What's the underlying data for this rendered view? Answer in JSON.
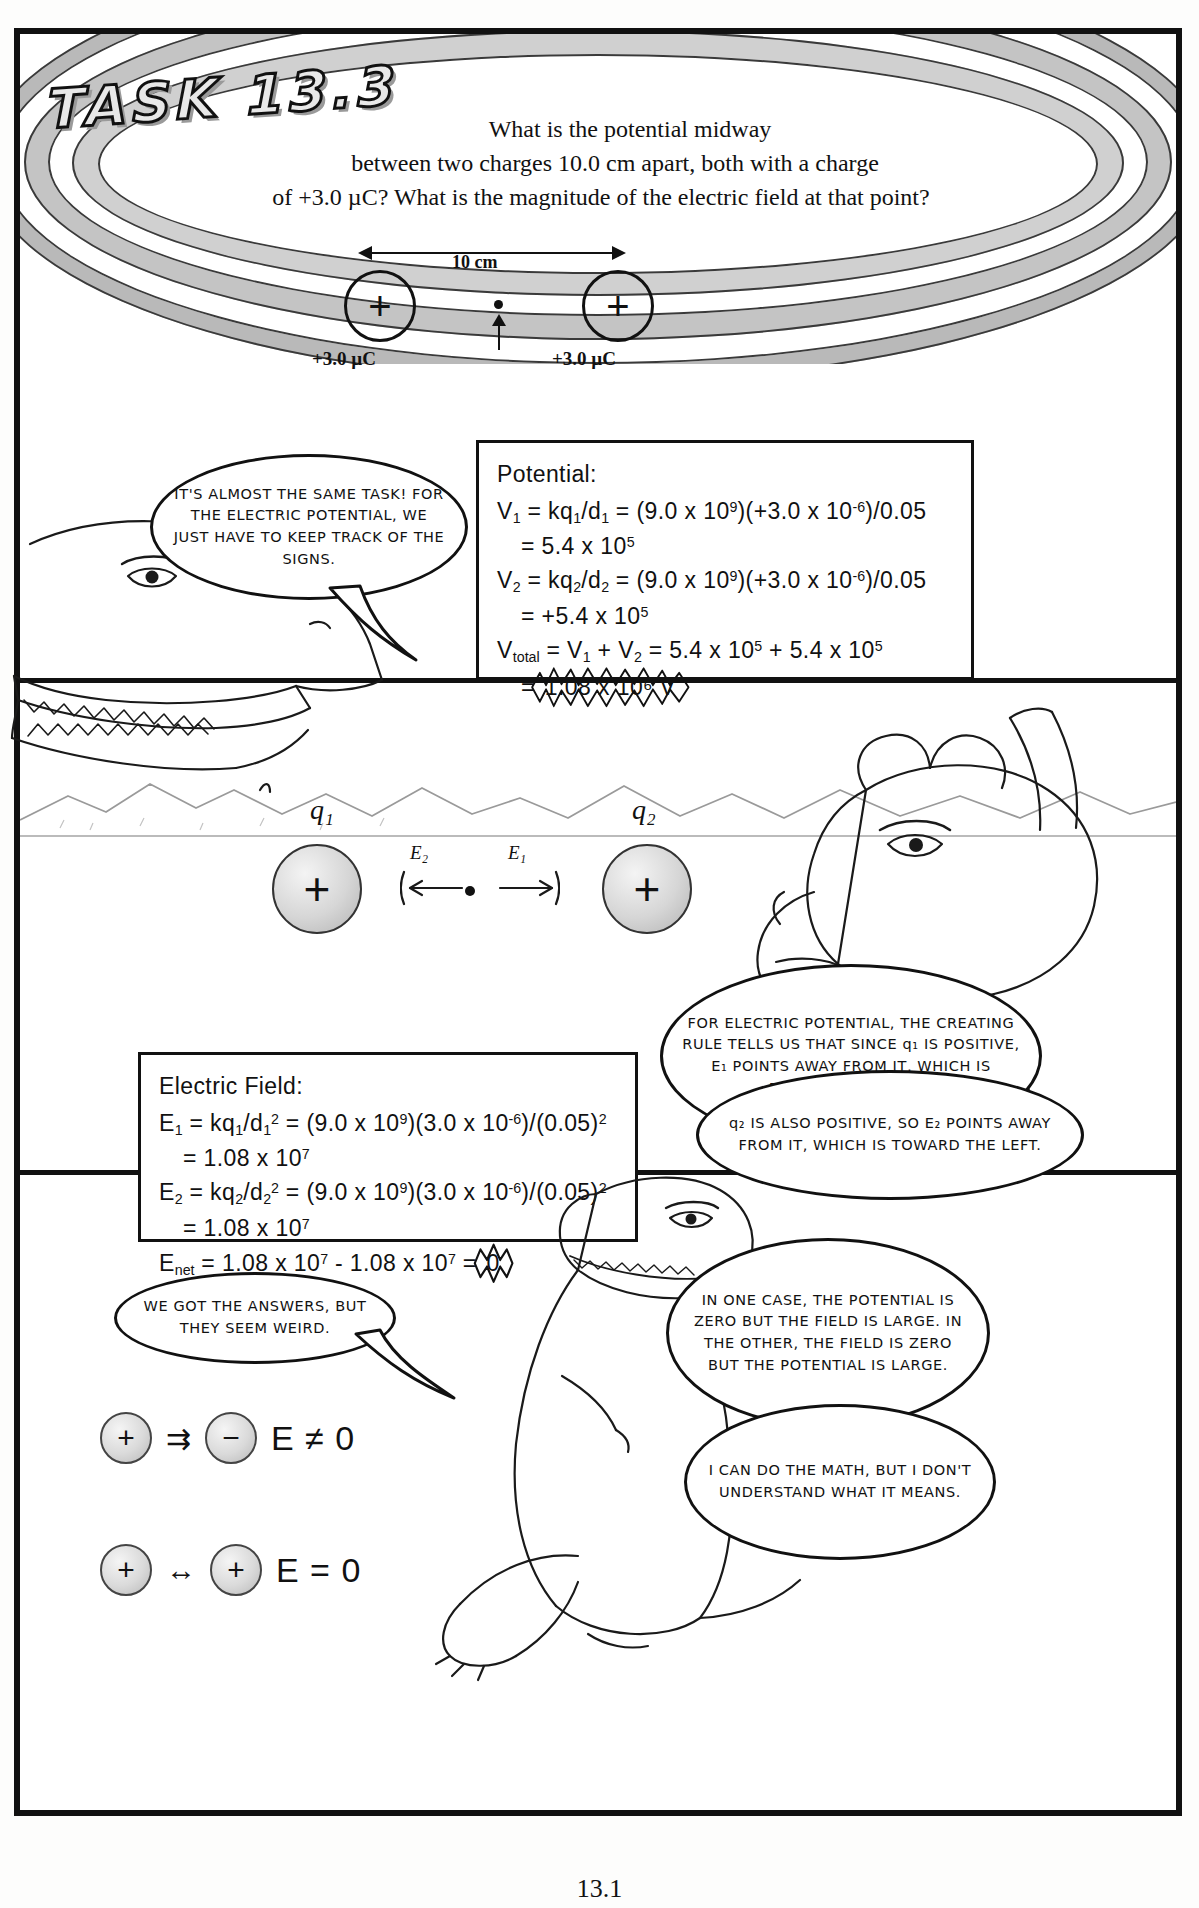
{
  "page": {
    "number": "13.1",
    "task_title": "TASK 13.3"
  },
  "problem": {
    "line1": "What is the potential midway",
    "line2": "between two charges 10.0 cm apart, both with a charge",
    "line3": "of +3.0 µC? What is the magnitude of the electric field at that point?"
  },
  "top_diagram": {
    "distance_label": "10 cm",
    "left_charge_symbol": "+",
    "right_charge_symbol": "+",
    "left_charge_label": "+3.0 µC",
    "right_charge_label": "+3.0 µC"
  },
  "balloons": {
    "b1": "IT'S ALMOST THE SAME TASK! FOR THE ELECTRIC POTENTIAL, WE JUST HAVE TO KEEP TRACK OF THE SIGNS.",
    "b2": "FOR ELECTRIC POTENTIAL, THE CREATING RULE TELLS US THAT SINCE q₁ IS POSITIVE, E₁ POINTS AWAY FROM IT, WHICH IS TOWARD THE RIGHT.",
    "b3": "q₂ IS ALSO POSITIVE, SO E₂ POINTS AWAY FROM IT, WHICH IS TOWARD THE LEFT.",
    "b4": "WE GOT THE ANSWERS, BUT THEY SEEM WEIRD.",
    "b5": "IN ONE CASE, THE POTENTIAL IS ZERO BUT THE FIELD IS LARGE. IN THE OTHER, THE FIELD IS ZERO BUT THE POTENTIAL IS LARGE.",
    "b6": "I CAN DO THE MATH, BUT I DON'T UNDERSTAND WHAT IT MEANS."
  },
  "potential_box": {
    "heading": "Potential:",
    "lines": [
      "V₁ = kq₁/d₁ = (9.0 x 10⁹)(+3.0 x 10⁻⁶)/0.05",
      "= 5.4 x 10⁵",
      "V₂ = kq₂/d₂ = (9.0 x 10⁹)(+3.0 x 10⁻⁶)/0.05",
      "= +5.4 x 10⁵",
      "Vₜₒₜₐₗ = V₁ + V₂ = 5.4 x 10⁵ + 5.4 x 10⁵",
      "= 1.08 x 10⁶ V"
    ],
    "answer": "1.08 x 10⁶ V"
  },
  "field_box": {
    "heading": "Electric Field:",
    "answer": "0"
  },
  "mid_diagram": {
    "q1_label": "q₁",
    "q2_label": "q₂",
    "e1_label": "E₁",
    "e2_label": "E₂",
    "left_charge_symbol": "+",
    "right_charge_symbol": "+"
  },
  "summary": {
    "row1": {
      "left_symbol": "+",
      "right_symbol": "−",
      "arrow": "⇉",
      "equation": "E ≠ 0"
    },
    "row2": {
      "left_symbol": "+",
      "right_symbol": "+",
      "arrow": "↔",
      "equation": "E = 0"
    }
  },
  "colors": {
    "ink": "#111111",
    "ring_light": "#d0d0d0",
    "ring_dark": "#b9b9b9",
    "charge_fill": "#d6d6d6",
    "paper": "#ffffff"
  }
}
